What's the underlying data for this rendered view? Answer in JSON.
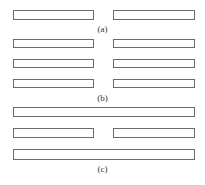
{
  "figure": {
    "panels": [
      {
        "label": "(a)",
        "rows": [
          {
            "type": "split"
          }
        ]
      },
      {
        "label": "(b)",
        "rows": [
          {
            "type": "split"
          },
          {
            "type": "split"
          },
          {
            "type": "split"
          }
        ]
      },
      {
        "label": "(c)",
        "rows": [
          {
            "type": "full"
          },
          {
            "type": "split"
          },
          {
            "type": "full"
          }
        ]
      }
    ],
    "colors": {
      "bar_border": "#6b6b6b",
      "bar_fill": "#ffffff",
      "label_text": "#333333",
      "background": "#ffffff"
    }
  }
}
